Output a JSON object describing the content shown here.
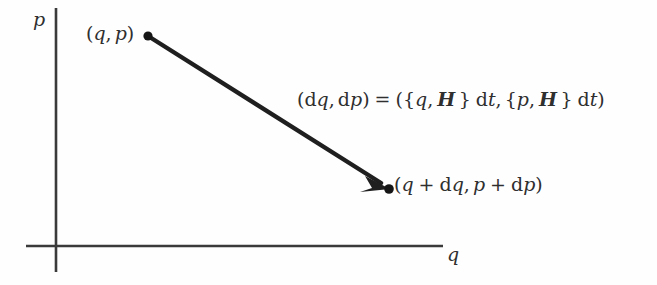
{
  "figure": {
    "background_color": "#fefefe",
    "ink_color": "#2f2f2f",
    "axes": {
      "vertical_label": "p",
      "horizontal_label": "q",
      "origin": {
        "x": 56,
        "y": 246
      },
      "vertical_extent": {
        "top_y": 8,
        "bottom_y": 272
      },
      "horizontal_extent": {
        "left_x": 26,
        "right_x": 443
      },
      "line_color": "#3a3a3a",
      "line_width": 2
    },
    "arrow": {
      "from": {
        "x": 148,
        "y": 36
      },
      "to": {
        "x": 389,
        "y": 188
      },
      "color": "#1f1f1f",
      "line_width": 4,
      "start_marker": "dot",
      "end_marker": "arrowhead-with-dot"
    },
    "labels": {
      "start_point": {
        "open_paren": "(",
        "q": "q",
        "comma": ",",
        "p": "p",
        "close_paren": ")"
      },
      "end_point": {
        "open_paren": "(",
        "q": "q",
        "plus_1": "+",
        "dq_d": "d",
        "dq_q": "q",
        "comma": ",",
        "p": "p",
        "plus_2": "+",
        "dp_d": "d",
        "dp_p": "p",
        "close_paren": ")"
      },
      "differential": {
        "lhs_open": "(",
        "lhs_dq_d": "d",
        "lhs_dq_q": "q",
        "lhs_comma": ",",
        "lhs_dp_d": "d",
        "lhs_dp_p": "p",
        "lhs_close": ")",
        "equals": "=",
        "rhs_open": "(",
        "brace1_open": "{",
        "rhs_q": "q",
        "rhs_comma1": ",",
        "hamiltonian_1": "H",
        "brace1_close": "}",
        "dt_1_d": "d",
        "dt_1_t": "t",
        "rhs_comma2": ",",
        "brace2_open": "{",
        "rhs_p": "p",
        "rhs_comma3": ",",
        "hamiltonian_2": "H",
        "brace2_close": "}",
        "dt_2_d": "d",
        "dt_2_t": "t",
        "rhs_close": ")"
      }
    }
  }
}
